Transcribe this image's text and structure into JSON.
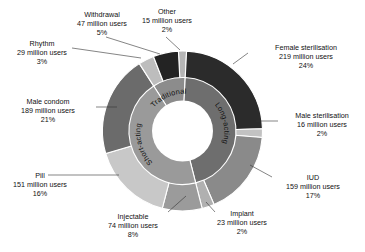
{
  "chart_data": {
    "type": "pie",
    "variant": "nested-donut",
    "title": "",
    "subtitle": "",
    "xlabel": "",
    "ylabel": "",
    "legend_position": "none",
    "grid": false,
    "units": "million users",
    "inner_ring": {
      "name": "Method category",
      "categories": [
        "Traditional",
        "Long-acting",
        "Short-acting"
      ],
      "values": [
        91,
        417,
        414
      ],
      "labels": [
        "Traditional",
        "Long-acting",
        "Short-acting"
      ],
      "colors": [
        "#8c8c8c",
        "#6e6e6e",
        "#9a9a9a"
      ]
    },
    "outer_ring": {
      "name": "Contraceptive method",
      "categories": [
        "Other",
        "Female sterilisation",
        "Male sterilisation",
        "IUD",
        "Implant",
        "Injectable",
        "Pill",
        "Male condom",
        "Rhythm",
        "Withdrawal"
      ],
      "values": [
        15,
        219,
        16,
        159,
        23,
        74,
        151,
        189,
        29,
        47
      ],
      "percents": [
        2,
        24,
        2,
        17,
        2,
        8,
        16,
        21,
        3,
        5
      ],
      "colors": [
        "#b5b5b5",
        "#2b2b2b",
        "#c2c2c2",
        "#8a8a8a",
        "#b0b0b0",
        "#9b9b9b",
        "#c8c8c8",
        "#6b6b6b",
        "#bdbdbd",
        "#232323"
      ]
    },
    "callouts": [
      {
        "key": "withdrawal",
        "name": "Withdrawal",
        "value": "47 million users",
        "percent": "5%"
      },
      {
        "key": "other",
        "name": "Other",
        "value": "15 million users",
        "percent": "2%"
      },
      {
        "key": "rhythm",
        "name": "Rhythm",
        "value": "29 million users",
        "percent": "3%"
      },
      {
        "key": "female_sterilisation",
        "name": "Female sterilisation",
        "value": "219 million users",
        "percent": "24%"
      },
      {
        "key": "male_condom",
        "name": "Male condom",
        "value": "189 million users",
        "percent": "21%"
      },
      {
        "key": "male_sterilisation",
        "name": "Male sterilisation",
        "value": "16 million users",
        "percent": "2%"
      },
      {
        "key": "iud",
        "name": "IUD",
        "value": "159 million users",
        "percent": "17%"
      },
      {
        "key": "pill",
        "name": "Pill",
        "value": "151 million users",
        "percent": "16%"
      },
      {
        "key": "injectable",
        "name": "Injectable",
        "value": "74 million users",
        "percent": "8%"
      },
      {
        "key": "implant",
        "name": "Implant",
        "value": "23 million users",
        "percent": "2%"
      }
    ]
  }
}
